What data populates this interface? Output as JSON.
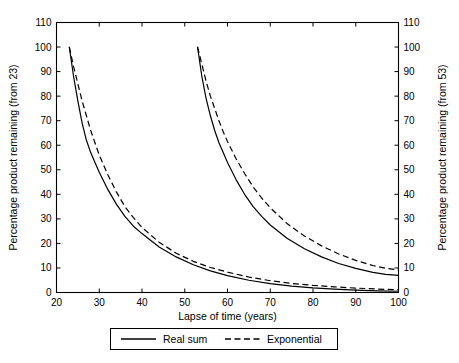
{
  "chart_data": {
    "type": "line",
    "title": "",
    "xlabel": "Lapse of time (years)",
    "ylabel": "Percentage product remaining (from 23)",
    "y2label": "Percentage product remaining (from 53)",
    "xlim": [
      20,
      100
    ],
    "ylim": [
      0,
      110
    ],
    "y2lim": [
      0,
      110
    ],
    "xticks": [
      20,
      30,
      40,
      50,
      60,
      70,
      80,
      90,
      100
    ],
    "yticks": [
      0,
      10,
      20,
      30,
      40,
      50,
      60,
      70,
      80,
      90,
      100,
      110
    ],
    "y2ticks": [
      0,
      10,
      20,
      30,
      40,
      50,
      60,
      70,
      80,
      90,
      100,
      110
    ],
    "grid": false,
    "legend_position": "below-axes",
    "legend": [
      "Real sum",
      "Exponential"
    ],
    "series": [
      {
        "name": "Real sum (from 23)",
        "style": "solid",
        "axis": "left",
        "x": [
          23,
          24,
          25,
          26,
          27,
          28,
          29,
          30,
          32,
          34,
          36,
          38,
          40,
          44,
          48,
          52,
          56,
          60,
          65,
          70,
          75,
          80,
          85,
          90,
          95,
          100
        ],
        "y": [
          100,
          88,
          78,
          69,
          62,
          57,
          53,
          49,
          42,
          36,
          31,
          27,
          24,
          18.5,
          14.5,
          11.3,
          8.8,
          6.9,
          5.0,
          3.6,
          2.6,
          1.9,
          1.4,
          1.0,
          0.7,
          0.5
        ]
      },
      {
        "name": "Exponential (from 23)",
        "style": "dashed",
        "axis": "left",
        "x": [
          23,
          24,
          25,
          26,
          27,
          28,
          29,
          30,
          32,
          34,
          36,
          38,
          40,
          44,
          48,
          52,
          56,
          60,
          65,
          70,
          75,
          80,
          85,
          90,
          95,
          100
        ],
        "y": [
          100,
          92,
          85,
          78,
          72,
          66,
          61,
          56,
          48,
          41,
          35,
          30.5,
          26.5,
          20.5,
          16.0,
          12.7,
          10.2,
          8.3,
          6.3,
          4.8,
          3.7,
          2.9,
          2.3,
          1.8,
          1.4,
          1.1
        ]
      },
      {
        "name": "Real sum (from 53)",
        "style": "solid",
        "axis": "right",
        "x": [
          53,
          54,
          55,
          56,
          57,
          58,
          59,
          60,
          62,
          64,
          66,
          68,
          70,
          74,
          78,
          82,
          86,
          90,
          94,
          97,
          100
        ],
        "y": [
          100,
          88,
          79,
          72,
          66,
          61,
          57,
          53,
          46,
          40,
          35,
          31,
          27.5,
          22,
          17.8,
          14.5,
          11.8,
          9.8,
          8.2,
          7.4,
          7.0
        ]
      },
      {
        "name": "Exponential (from 53)",
        "style": "dashed",
        "axis": "right",
        "x": [
          53,
          54,
          55,
          56,
          57,
          58,
          59,
          60,
          62,
          64,
          66,
          68,
          70,
          74,
          78,
          82,
          86,
          90,
          94,
          97,
          100
        ],
        "y": [
          100,
          93,
          86,
          80,
          75,
          70,
          65.5,
          61.5,
          54.5,
          48.5,
          43,
          38.5,
          34.5,
          28,
          23,
          19,
          15.7,
          13.1,
          11.0,
          9.9,
          9.2
        ]
      }
    ]
  },
  "axes": {
    "x_title": "Lapse of time (years)",
    "y_left_title": "Percentage product remaining (from 23)",
    "y_right_title": "Percentage product remaining (from 53)",
    "x_tick_labels": [
      "20",
      "30",
      "40",
      "50",
      "60",
      "70",
      "80",
      "90",
      "100"
    ],
    "y_left_tick_labels": [
      "0",
      "10",
      "20",
      "30",
      "40",
      "50",
      "60",
      "70",
      "80",
      "90",
      "100",
      "110"
    ],
    "y_right_tick_labels": [
      "0",
      "10",
      "20",
      "30",
      "40",
      "50",
      "60",
      "70",
      "80",
      "90",
      "100",
      "110"
    ]
  },
  "legend": {
    "items": [
      {
        "label": "Real sum",
        "style": "solid"
      },
      {
        "label": "Exponential",
        "style": "dashed"
      }
    ]
  },
  "colors": {
    "ink": "#000000",
    "background": "#ffffff"
  }
}
